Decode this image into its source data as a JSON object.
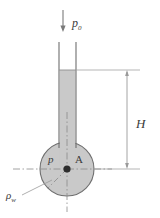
{
  "figure": {
    "labels": {
      "top_pressure": "p",
      "top_pressure_sub": "0",
      "height": "H",
      "inner_pressure": "p",
      "point": "A",
      "density": "ρ",
      "density_sub": "w"
    },
    "colors": {
      "fluid_fill": "#c9c9c9",
      "bulb_fill": "#c9c9c9",
      "outline": "#6e6e6e",
      "centerline": "#8a8a8a",
      "dimension": "#9a9a9a",
      "text": "#3b3b3b",
      "background": "#ffffff"
    },
    "geometry": {
      "tube_left_x": 59,
      "tube_right_x": 76,
      "tube_top_y": 42,
      "fluid_level_y": 70,
      "bulb_center_x": 67,
      "bulb_center_y": 169,
      "bulb_radius": 27,
      "dimension_line_x": 127,
      "arrow_x": 63,
      "arrow_top_y": 10,
      "arrow_tip_y": 31
    }
  }
}
